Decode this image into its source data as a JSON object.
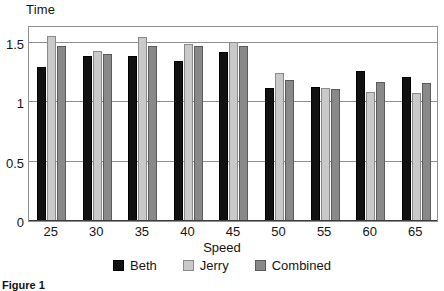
{
  "chart_data": {
    "type": "bar",
    "title": "",
    "xlabel": "Speed",
    "ylabel": "Time",
    "categories": [
      "25",
      "30",
      "35",
      "40",
      "45",
      "50",
      "55",
      "60",
      "65"
    ],
    "series": [
      {
        "name": "Beth",
        "color": "#111111",
        "values": [
          1.3,
          1.39,
          1.39,
          1.35,
          1.42,
          1.12,
          1.13,
          1.26,
          1.21
        ]
      },
      {
        "name": "Jerry",
        "color": "#c9c9c9",
        "values": [
          1.56,
          1.43,
          1.55,
          1.49,
          1.51,
          1.25,
          1.12,
          1.09,
          1.08
        ]
      },
      {
        "name": "Combined",
        "color": "#898989",
        "values": [
          1.47,
          1.41,
          1.47,
          1.47,
          1.47,
          1.19,
          1.11,
          1.17,
          1.16
        ]
      }
    ],
    "ylim": [
      0,
      1.65
    ],
    "yticks": [
      0,
      0.5,
      1,
      1.5
    ],
    "ytick_labels": [
      "0",
      "0.5",
      "1",
      "1.5"
    ],
    "grid": true,
    "legend_position": "bottom"
  },
  "caption": "Figure 1",
  "axis": {
    "y_title": "Time",
    "x_title": "Speed"
  }
}
